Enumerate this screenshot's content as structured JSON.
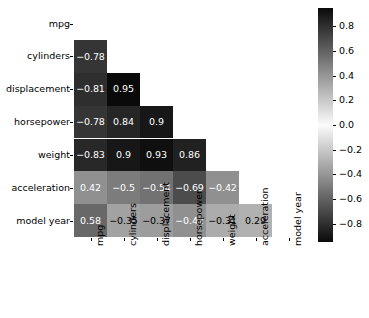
{
  "chart_data": {
    "type": "heatmap",
    "title": "",
    "xlabel": "",
    "ylabel": "",
    "grid": false,
    "mask": "lower-triangle (diagonal and upper triangle hidden)",
    "colormap": "diverging grayscale (dark at extremes, white at 0)",
    "vmin": -0.95,
    "vmax": 0.95,
    "x_categories": [
      "mpg",
      "cylinders",
      "displacement",
      "horsepower",
      "weight",
      "acceleration",
      "model year"
    ],
    "y_categories": [
      "mpg",
      "cylinders",
      "displacement",
      "horsepower",
      "weight",
      "acceleration",
      "model year"
    ],
    "rows": [
      {
        "label": "mpg",
        "cells": []
      },
      {
        "label": "cylinders",
        "cells": [
          {
            "x": "mpg",
            "v": -0.78
          }
        ]
      },
      {
        "label": "displacement",
        "cells": [
          {
            "x": "mpg",
            "v": -0.81
          },
          {
            "x": "cylinders",
            "v": 0.95
          }
        ]
      },
      {
        "label": "horsepower",
        "cells": [
          {
            "x": "mpg",
            "v": -0.78
          },
          {
            "x": "cylinders",
            "v": 0.84
          },
          {
            "x": "displacement",
            "v": 0.9
          }
        ]
      },
      {
        "label": "weight",
        "cells": [
          {
            "x": "mpg",
            "v": -0.83
          },
          {
            "x": "cylinders",
            "v": 0.9
          },
          {
            "x": "displacement",
            "v": 0.93
          },
          {
            "x": "horsepower",
            "v": 0.86
          }
        ]
      },
      {
        "label": "acceleration",
        "cells": [
          {
            "x": "mpg",
            "v": 0.42
          },
          {
            "x": "cylinders",
            "v": -0.5
          },
          {
            "x": "displacement",
            "v": -0.54
          },
          {
            "x": "horsepower",
            "v": -0.69
          },
          {
            "x": "weight",
            "v": -0.42
          }
        ]
      },
      {
        "label": "model year",
        "cells": [
          {
            "x": "mpg",
            "v": 0.58
          },
          {
            "x": "cylinders",
            "v": -0.35
          },
          {
            "x": "displacement",
            "v": -0.37
          },
          {
            "x": "horsepower",
            "v": -0.42
          },
          {
            "x": "weight",
            "v": -0.31
          },
          {
            "x": "acceleration",
            "v": 0.29
          }
        ]
      }
    ],
    "annotations": [
      "-0.78",
      "-0.81",
      "0.95",
      "-0.78",
      "0.84",
      "0.9",
      "-0.83",
      "0.9",
      "0.93",
      "0.86",
      "0.42",
      "-0.5",
      "-0.54",
      "-0.69",
      "-0.42",
      "0.58",
      "-0.35",
      "-0.37",
      "-0.42",
      "-0.31",
      "0.29"
    ],
    "colorbar": {
      "position": "right",
      "ticks": [
        0.8,
        0.6,
        0.4,
        0.2,
        0.0,
        -0.2,
        -0.4,
        -0.6,
        -0.8
      ],
      "tick_labels": [
        "0.8",
        "0.6",
        "0.4",
        "0.2",
        "0.0",
        "−0.2",
        "−0.4",
        "−0.6",
        "−0.8"
      ],
      "range": [
        -0.95,
        0.95
      ]
    },
    "colors": {
      "background": "#ffffff",
      "text": "#000000",
      "annotation_light": "#ffffff",
      "annotation_dark": "#000000",
      "extreme_dark": "#0a0a0a",
      "center_white": "#fbfbfb"
    }
  }
}
